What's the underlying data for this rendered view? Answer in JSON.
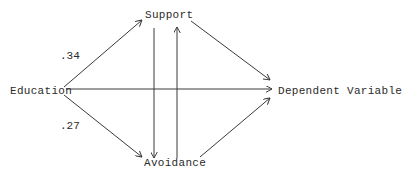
{
  "diagram": {
    "type": "path-model",
    "nodes": {
      "education": "Education",
      "support": "Support",
      "avoidance": "Avoidance",
      "dependent": "Dependent Variable"
    },
    "coefficients": {
      "education_to_support": ".34",
      "education_to_avoidance": ".27"
    },
    "edges": [
      {
        "from": "Education",
        "to": "Support",
        "label": ".34"
      },
      {
        "from": "Education",
        "to": "Avoidance",
        "label": ".27"
      },
      {
        "from": "Education",
        "to": "Dependent Variable",
        "label": ""
      },
      {
        "from": "Support",
        "to": "Avoidance",
        "label": ""
      },
      {
        "from": "Avoidance",
        "to": "Support",
        "label": ""
      },
      {
        "from": "Support",
        "to": "Dependent Variable",
        "label": ""
      },
      {
        "from": "Avoidance",
        "to": "Dependent Variable",
        "label": ""
      }
    ],
    "line_color": "#3a3a3a"
  }
}
